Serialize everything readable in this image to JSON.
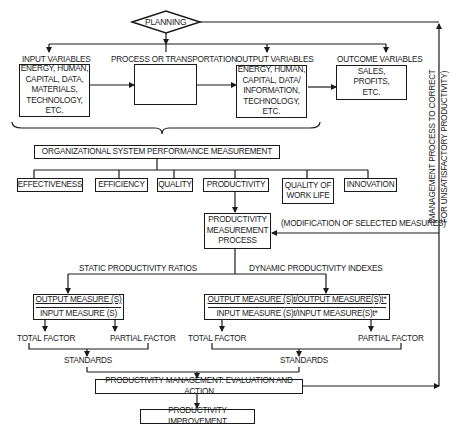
{
  "planning": {
    "label": "PLANNING"
  },
  "top_row": {
    "input": {
      "title": "INPUT VARIABLES",
      "body": "ENERGY, HUMAN,\nCAPITAL, DATA,\nMATERIALS,\nTECHNOLOGY, ETC."
    },
    "process": {
      "title": "PROCESS OR TRANSPORTATION",
      "body": ""
    },
    "output": {
      "title": "OUTPUT VARIABLES",
      "body": "ENERGY, HUMAN,\nCAPITAL, DATA/\nINFORMATION,\nTECHNOLOGY, ETC."
    },
    "outcome": {
      "title": "OUTCOME VARIABLES",
      "body": "SALES,\nPROFITS,\nETC."
    }
  },
  "feedback_side": {
    "line1": "(MANAGEMENT PROCESS TO CORRECT",
    "line2": "FOR UNSATISFACTORY PRODUCTIVITY)"
  },
  "performance": {
    "title": "ORGANIZATIONAL SYSTEM PERFORMANCE MEASUREMENT",
    "criteria": [
      "EFFECTIVENESS",
      "EFFICIENCY",
      "QUALITY",
      "PRODUCTIVITY",
      "QUALITY OF\nWORK LIFE",
      "INNOVATION"
    ]
  },
  "measurement": {
    "process": "PRODUCTIVITY\nMEASUREMENT\nPROCESS",
    "modification": "(MODIFICATION OF SELECTED MEASURES)"
  },
  "static": {
    "label": "STATIC PRODUCTIVITY RATIOS",
    "numerator": "OUTPUT MEASURE (S)",
    "denominator": "INPUT MEASURE (S)",
    "total": "TOTAL FACTOR",
    "partial": "PARTIAL FACTOR",
    "standards": "STANDARDS"
  },
  "dynamic": {
    "label": "DYNAMIC PRODUCTIVITY INDEXES",
    "numerator": "OUTPUT MEASURE (S)t/OUTPUT MEASURE(S)t*",
    "denominator": "INPUT MEASURE (S)t/INPUT MEASURE(S)t*",
    "total": "TOTAL FACTOR",
    "partial": "PARTIAL FACTOR",
    "standards": "STANDARDS"
  },
  "management": {
    "label": "PRODUCTIVITY MANAGEMENT: EVALUATION AND ACTION"
  },
  "improvement": {
    "label": "PRODUCTIVITY IMPROVEMENT"
  }
}
